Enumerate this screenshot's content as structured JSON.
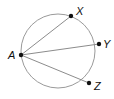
{
  "diagram": {
    "type": "circle-chords",
    "circle": {
      "cx": 58,
      "cy": 51,
      "r": 37,
      "stroke": "#9a9a9a"
    },
    "points": [
      {
        "id": "A",
        "label": "A",
        "x": 21,
        "y": 55,
        "lx": 8,
        "ly": 59
      },
      {
        "id": "X",
        "label": "X",
        "x": 71,
        "y": 16,
        "lx": 76,
        "ly": 15
      },
      {
        "id": "Y",
        "label": "Y",
        "x": 99,
        "y": 44,
        "lx": 103,
        "ly": 48
      },
      {
        "id": "Z",
        "label": "Z",
        "x": 89,
        "y": 83,
        "lx": 94,
        "ly": 90
      }
    ],
    "segments": [
      {
        "from": "A",
        "to": "X"
      },
      {
        "from": "A",
        "to": "Y"
      },
      {
        "from": "A",
        "to": "Z"
      }
    ],
    "line_color": "#8c8c8c",
    "point_color": "#111111"
  }
}
